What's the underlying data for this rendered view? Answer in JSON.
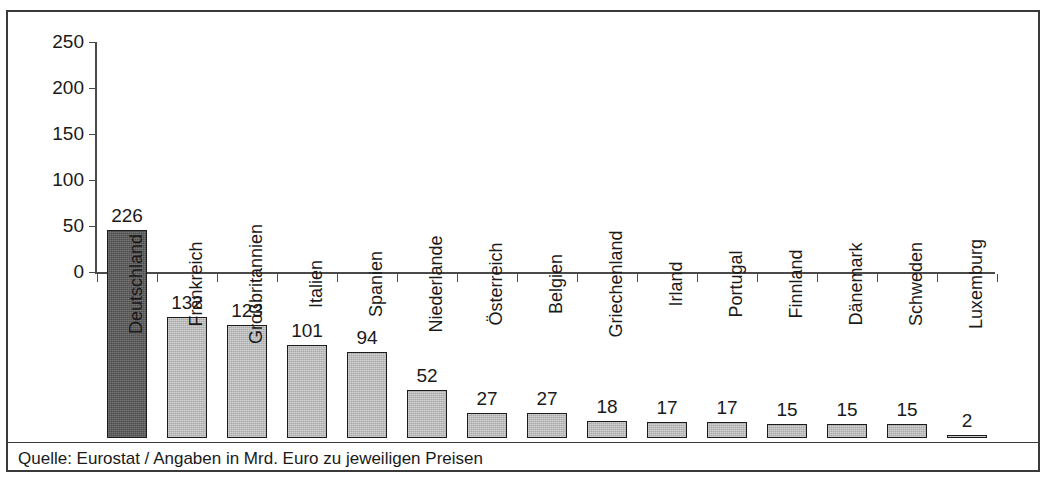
{
  "chart_data": {
    "type": "bar",
    "title": "",
    "subtitle": "",
    "xlabel": "",
    "ylabel": "",
    "ylim": [
      0,
      250
    ],
    "yticks": [
      0,
      50,
      100,
      150,
      200,
      250
    ],
    "grid": false,
    "legend": "none",
    "units": "Mrd. Euro",
    "categories": [
      "Deutschland",
      "Frankreich",
      "Großbritannien",
      "Italien",
      "Spanien",
      "Niederlande",
      "Österreich",
      "Belgien",
      "Griechenland",
      "Irland",
      "Portugal",
      "Finnland",
      "Dänemark",
      "Schweden",
      "Luxemburg"
    ],
    "values": [
      226,
      132,
      123,
      101,
      94,
      52,
      27,
      27,
      18,
      17,
      17,
      15,
      15,
      15,
      2
    ],
    "value_labels": [
      "226",
      "132",
      "123",
      "101",
      "94",
      "52",
      "27",
      "27",
      "18",
      "17",
      "17",
      "15",
      "15",
      "15",
      "2"
    ],
    "highlight_index": 0,
    "colors": {
      "bar_default": "#a9a9a9",
      "bar_highlight": "#4c4c4c",
      "bar_outline": "#1c1c1c",
      "axis": "#4a4a4a",
      "text": "#1a1a1a",
      "frame": "#3a3a3a",
      "background": "#ffffff"
    }
  },
  "footer": {
    "source_note": "Quelle: Eurostat / Angaben in Mrd. Euro zu jeweiligen Preisen"
  }
}
